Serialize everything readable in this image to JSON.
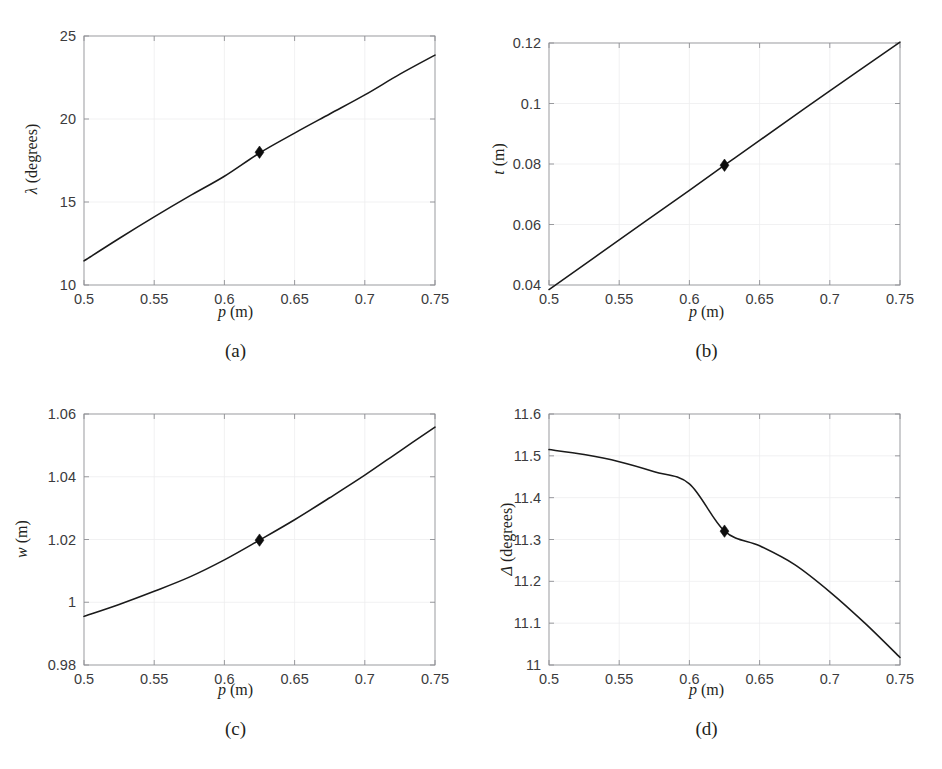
{
  "figure": {
    "background": "#ffffff",
    "curve_color": "#1a1a1a",
    "grid_color": "#eeeeef",
    "axis_color": "#8f9094",
    "marker_color": "#0d0d0d"
  },
  "panels": [
    {
      "id": "a",
      "caption": "(a)",
      "xlabel_symbol": "p",
      "xlabel_unit": "(m)",
      "ylabel_symbol": "λ",
      "ylabel_unit": "(degrees)"
    },
    {
      "id": "b",
      "caption": "(b)",
      "xlabel_symbol": "p",
      "xlabel_unit": "(m)",
      "ylabel_symbol": "t",
      "ylabel_unit": "(m)"
    },
    {
      "id": "c",
      "caption": "(c)",
      "xlabel_symbol": "p",
      "xlabel_unit": "(m)",
      "ylabel_symbol": "w",
      "ylabel_unit": "(m)"
    },
    {
      "id": "d",
      "caption": "(d)",
      "xlabel_symbol": "p",
      "xlabel_unit": "(m)",
      "ylabel_symbol": "Δ",
      "ylabel_unit": "(degrees)"
    }
  ],
  "chart_data": [
    {
      "type": "line",
      "panel": "a",
      "title": "(a)",
      "xlabel": "p (m)",
      "ylabel": "λ (degrees)",
      "xlim": [
        0.5,
        0.75
      ],
      "ylim": [
        10,
        25
      ],
      "xticks": [
        0.5,
        0.55,
        0.6,
        0.65,
        0.7,
        0.75
      ],
      "xticklabels": [
        "0.5",
        "0.55",
        "0.6",
        "0.65",
        "0.7",
        "0.75"
      ],
      "yticks": [
        10,
        15,
        20,
        25
      ],
      "yticklabels": [
        "10",
        "15",
        "20",
        "25"
      ],
      "grid": true,
      "legend": null,
      "x": [
        0.5,
        0.525,
        0.55,
        0.575,
        0.6,
        0.625,
        0.65,
        0.675,
        0.7,
        0.725,
        0.75
      ],
      "y": [
        11.45,
        12.18,
        12.9,
        13.6,
        14.3,
        14.98,
        15.65,
        16.3,
        16.95,
        17.58,
        18.2
      ],
      "series": [
        {
          "name": "lambda",
          "x": [
            0.5,
            0.525,
            0.55,
            0.575,
            0.6,
            0.625,
            0.65,
            0.675,
            0.7,
            0.725,
            0.75
          ],
          "values": [
            11.45,
            12.8,
            14.1,
            15.35,
            16.55,
            17.95,
            19.15,
            20.3,
            21.45,
            22.7,
            23.85
          ]
        }
      ],
      "markers": [
        {
          "x": 0.625,
          "y": 18.0,
          "shape": "diamond",
          "filled": true
        }
      ]
    },
    {
      "type": "line",
      "panel": "b",
      "title": "(b)",
      "xlabel": "p (m)",
      "ylabel": "t (m)",
      "xlim": [
        0.5,
        0.75
      ],
      "ylim": [
        0.04,
        0.12
      ],
      "xticks": [
        0.5,
        0.55,
        0.6,
        0.65,
        0.7,
        0.75
      ],
      "xticklabels": [
        "0.5",
        "0.55",
        "0.6",
        "0.65",
        "0.7",
        "0.75"
      ],
      "yticks": [
        0.04,
        0.06,
        0.08,
        0.1,
        0.12
      ],
      "yticklabels": [
        "0.04",
        "0.06",
        "0.08",
        "0.1",
        "0.12"
      ],
      "grid": true,
      "legend": null,
      "series": [
        {
          "name": "t",
          "x": [
            0.5,
            0.55,
            0.6,
            0.625,
            0.65,
            0.7,
            0.75
          ],
          "values": [
            0.0385,
            0.0549,
            0.0713,
            0.0796,
            0.0878,
            0.1042,
            0.1203
          ]
        }
      ],
      "markers": [
        {
          "x": 0.625,
          "y": 0.0796,
          "shape": "diamond",
          "filled": true
        }
      ]
    },
    {
      "type": "line",
      "panel": "c",
      "title": "(c)",
      "xlabel": "p (m)",
      "ylabel": "w (m)",
      "xlim": [
        0.5,
        0.75
      ],
      "ylim": [
        0.98,
        1.06
      ],
      "xticks": [
        0.5,
        0.55,
        0.6,
        0.65,
        0.7,
        0.75
      ],
      "xticklabels": [
        "0.5",
        "0.55",
        "0.6",
        "0.65",
        "0.7",
        "0.75"
      ],
      "yticks": [
        0.98,
        1.0,
        1.02,
        1.04,
        1.06
      ],
      "yticklabels": [
        "0.98",
        "1",
        "1.02",
        "1.04",
        "1.06"
      ],
      "grid": true,
      "legend": null,
      "series": [
        {
          "name": "w",
          "x": [
            0.5,
            0.525,
            0.55,
            0.575,
            0.6,
            0.625,
            0.65,
            0.675,
            0.7,
            0.725,
            0.75
          ],
          "values": [
            0.9955,
            0.9993,
            1.0035,
            1.008,
            1.0135,
            1.0198,
            1.0263,
            1.0333,
            1.0405,
            1.0482,
            1.0558
          ]
        }
      ],
      "markers": [
        {
          "x": 0.625,
          "y": 1.0198,
          "shape": "diamond",
          "filled": true
        }
      ]
    },
    {
      "type": "line",
      "panel": "d",
      "title": "(d)",
      "xlabel": "p (m)",
      "ylabel": "Δ (degrees)",
      "xlim": [
        0.5,
        0.75
      ],
      "ylim": [
        11,
        11.6
      ],
      "xticks": [
        0.5,
        0.55,
        0.6,
        0.65,
        0.7,
        0.75
      ],
      "xticklabels": [
        "0.5",
        "0.55",
        "0.6",
        "0.65",
        "0.7",
        "0.75"
      ],
      "yticks": [
        11,
        11.1,
        11.2,
        11.3,
        11.4,
        11.5,
        11.6
      ],
      "yticklabels": [
        "11",
        "11.1",
        "11.2",
        "11.3",
        "11.4",
        "11.5",
        "11.6"
      ],
      "grid": true,
      "legend": null,
      "series": [
        {
          "name": "Delta",
          "x": [
            0.5,
            0.525,
            0.55,
            0.575,
            0.6,
            0.625,
            0.65,
            0.675,
            0.7,
            0.725,
            0.75
          ],
          "values": [
            11.515,
            11.503,
            11.486,
            11.462,
            11.433,
            11.32,
            11.285,
            11.24,
            11.175,
            11.1,
            11.018
          ]
        }
      ],
      "markers": [
        {
          "x": 0.625,
          "y": 11.32,
          "shape": "diamond",
          "filled": true
        }
      ]
    }
  ]
}
